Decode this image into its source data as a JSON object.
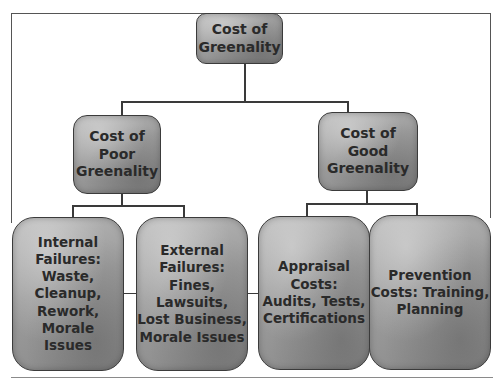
{
  "diagram": {
    "title": "Cost of Greenality",
    "root": {
      "label": "Cost of Greenality",
      "lines": [
        "Cost of",
        "Greenality"
      ]
    },
    "branches": [
      {
        "label": "Cost of Poor Greenality",
        "lines": [
          "Cost of",
          "Poor",
          "Greenality"
        ],
        "children": [
          {
            "label": "Internal Failures: Waste, Cleanup, Rework, Morale Issues",
            "lines": [
              "Internal",
              "Failures:",
              "Waste,",
              "Cleanup,",
              "Rework,",
              "Morale",
              "Issues"
            ]
          },
          {
            "label": "External Failures: Fines, Lawsuits, Lost Business, Morale Issues",
            "lines": [
              "External",
              "Failures:",
              "Fines,",
              "Lawsuits,",
              "Lost Business,",
              "Morale Issues"
            ]
          }
        ]
      },
      {
        "label": "Cost of Good Greenality",
        "lines": [
          "Cost of Good",
          "Greenality"
        ],
        "children": [
          {
            "label": "Appraisal Costs: Audits, Tests, Certifications",
            "lines": [
              "Appraisal",
              "Costs:",
              "Audits, Tests,",
              "Certifications"
            ]
          },
          {
            "label": "Prevention Costs: Training, Planning",
            "lines": [
              "Prevention",
              "Costs: Training,",
              "Planning"
            ]
          }
        ]
      }
    ]
  },
  "colors": {
    "node_fill": "#9c9c9c",
    "node_border": "#3b3b3b",
    "connector": "#3a3a3a",
    "text": "#2a2a2a"
  }
}
